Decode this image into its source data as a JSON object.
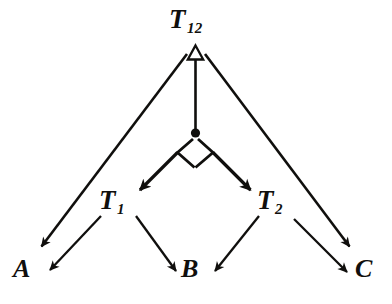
{
  "diagram": {
    "stroke_color": "#100f0d",
    "background_color": "#ffffff",
    "nodes": [
      {
        "id": "t12",
        "base": "T",
        "sub": "12",
        "x": 195,
        "y": 22
      },
      {
        "id": "t1",
        "base": "T",
        "sub": "1",
        "x": 118,
        "y": 203
      },
      {
        "id": "t2",
        "base": "T",
        "sub": "2",
        "x": 276,
        "y": 203
      },
      {
        "id": "a",
        "base": "A",
        "sub": "",
        "x": 26,
        "y": 272
      },
      {
        "id": "b",
        "base": "B",
        "sub": "",
        "x": 194,
        "y": 272
      },
      {
        "id": "c",
        "base": "C",
        "sub": "",
        "x": 368,
        "y": 272
      }
    ],
    "edges": [
      {
        "id": "t12-to-a",
        "from": "t12",
        "to": "a",
        "arrowhead": "filled-open"
      },
      {
        "id": "t12-to-c",
        "from": "t12",
        "to": "c",
        "arrowhead": "filled-open"
      },
      {
        "id": "junction-to-t12",
        "from": "junction",
        "to": "t12",
        "arrowhead": "hollow-triangle"
      },
      {
        "id": "junction-to-t1",
        "from": "junction",
        "to": "t1",
        "arrowhead": "filled-solid"
      },
      {
        "id": "junction-to-t2",
        "from": "junction",
        "to": "t2",
        "arrowhead": "filled-solid"
      },
      {
        "id": "t1-to-a",
        "from": "t1",
        "to": "a",
        "arrowhead": "filled-open"
      },
      {
        "id": "t1-to-b",
        "from": "t1",
        "to": "b",
        "arrowhead": "filled-open"
      },
      {
        "id": "t2-to-b",
        "from": "t2",
        "to": "b",
        "arrowhead": "filled-open"
      },
      {
        "id": "t2-to-c",
        "from": "t2",
        "to": "c",
        "arrowhead": "filled-open"
      }
    ],
    "junction": {
      "id": "junction",
      "type": "merge-dot-with-diamond",
      "x": 195,
      "y": 133
    }
  }
}
